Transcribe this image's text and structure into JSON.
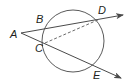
{
  "diagram": {
    "type": "geometry-circle-secants",
    "colors": {
      "line": "#4a4a4a",
      "circle": "#5a5a5a",
      "label": "#231f20",
      "background": "#ffffff"
    },
    "circle": {
      "cx": 73,
      "cy": 41,
      "r": 31
    },
    "points": {
      "A": {
        "label": "A",
        "x": 21,
        "y": 33,
        "lx": 10,
        "ly": 38
      },
      "B": {
        "label": "B",
        "x": 44,
        "y": 28,
        "lx": 36,
        "ly": 23
      },
      "C": {
        "label": "C",
        "x": 45,
        "y": 43,
        "lx": 35,
        "ly": 52
      },
      "D": {
        "label": "D",
        "x": 100,
        "y": 19,
        "lx": 98,
        "ly": 14
      },
      "E": {
        "label": "E",
        "x": 97,
        "y": 65,
        "lx": 93,
        "ly": 79
      }
    },
    "segments": [
      {
        "name": "ray-A-D",
        "from": "A",
        "to_xy": [
          123,
          15
        ],
        "style": "solid",
        "arrow": true
      },
      {
        "name": "ray-A-E",
        "from": "A",
        "to_xy": [
          121,
          78
        ],
        "style": "solid",
        "arrow": true
      },
      {
        "name": "chord-C-D",
        "from": "C",
        "to": "D",
        "style": "dashed",
        "arrow": false
      }
    ]
  }
}
